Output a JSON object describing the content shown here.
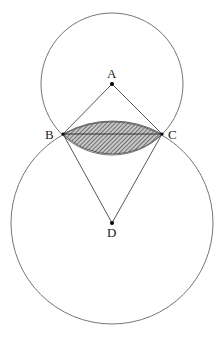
{
  "diagram": {
    "points": {
      "A": {
        "label": "A",
        "x": 112,
        "y": 84
      },
      "B": {
        "label": "B",
        "x": 63,
        "y": 134
      },
      "C": {
        "label": "C",
        "x": 162,
        "y": 134
      },
      "D": {
        "label": "D",
        "x": 112,
        "y": 223
      }
    },
    "circles": [
      {
        "center": "A",
        "radius": 71
      },
      {
        "center": "D",
        "radius": 101
      }
    ],
    "segments": [
      [
        "A",
        "B"
      ],
      [
        "A",
        "C"
      ],
      [
        "B",
        "C"
      ],
      [
        "B",
        "D"
      ],
      [
        "C",
        "D"
      ]
    ],
    "shaded_region": "lens between circle A and circle D bounded by chord BC",
    "colors": {
      "stroke": "#555555",
      "hatch": "#333333",
      "fill": "#bbbbbb"
    }
  }
}
